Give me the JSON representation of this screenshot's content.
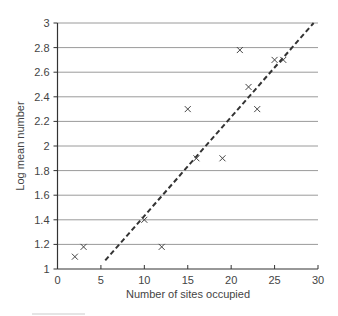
{
  "chart_data": {
    "type": "scatter",
    "title": "",
    "xlabel": "Number of sites occupied",
    "ylabel": "Log mean number",
    "xlim": [
      0,
      30
    ],
    "ylim": [
      1,
      3
    ],
    "x_ticks": [
      0,
      5,
      10,
      15,
      20,
      25,
      30
    ],
    "y_ticks": [
      1,
      1.2,
      1.4,
      1.6,
      1.8,
      2,
      2.2,
      2.4,
      2.6,
      2.8,
      3
    ],
    "y_tick_labels": [
      "1",
      "1.2",
      "1.4",
      "1.6",
      "1.8",
      "2",
      "2.2",
      "2.4",
      "2.6",
      "2.8",
      "3"
    ],
    "grid": "horizontal",
    "legend": null,
    "marker": "x",
    "points": [
      {
        "x": 2,
        "y": 1.1
      },
      {
        "x": 3,
        "y": 1.18
      },
      {
        "x": 10,
        "y": 1.4
      },
      {
        "x": 12,
        "y": 1.18
      },
      {
        "x": 15,
        "y": 2.3
      },
      {
        "x": 16,
        "y": 1.9
      },
      {
        "x": 19,
        "y": 1.9
      },
      {
        "x": 21,
        "y": 2.78
      },
      {
        "x": 22,
        "y": 2.48
      },
      {
        "x": 23,
        "y": 2.3
      },
      {
        "x": 25,
        "y": 2.7
      },
      {
        "x": 26,
        "y": 2.7
      }
    ],
    "trend_line": {
      "style": "dashed",
      "x1": 5.5,
      "y1": 1.07,
      "x2": 29.5,
      "y2": 3.0
    }
  },
  "colors": {
    "grid": "#9a9a9a",
    "axis": "#333333",
    "marker": "#444444",
    "trend": "#333333"
  }
}
